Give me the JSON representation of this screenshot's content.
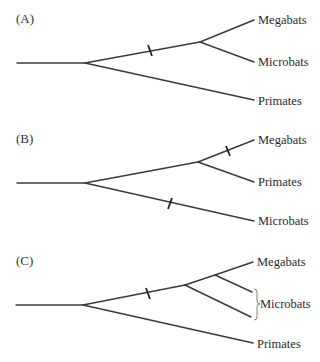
{
  "figure": {
    "panels": [
      {
        "label": "(A)",
        "taxa": [
          "Megabats",
          "Microbats",
          "Primates"
        ],
        "description": "Megabats and Microbats sister taxa; single trait-origin mark on shared bat branch"
      },
      {
        "label": "(B)",
        "taxa": [
          "Megabats",
          "Primates",
          "Microbats"
        ],
        "description": "Megabats sister to Primates; trait-origin marks on Megabats branch and Microbats branch"
      },
      {
        "label": "(C)",
        "taxa": [
          "Megabats",
          "Microbats",
          "Primates"
        ],
        "brace_label": "Microbats",
        "description": "Microbats paraphyletic; single trait-origin mark on branch leading to all bats"
      }
    ],
    "colors": {
      "branch": "#3a3a3a",
      "text": "#2a2a2a",
      "background": "#ffffff"
    }
  }
}
